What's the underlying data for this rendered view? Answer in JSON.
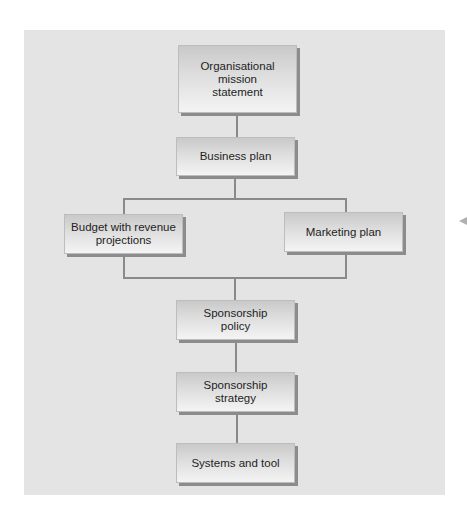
{
  "diagram": {
    "type": "hierarchy-flowchart",
    "nodes": {
      "mission": {
        "label": "Organisational mission statement",
        "lines": [
          "Organisational",
          "mission",
          "statement"
        ]
      },
      "business_plan": {
        "label": "Business plan",
        "lines": [
          "Business plan"
        ]
      },
      "budget": {
        "label": "Budget with revenue projections",
        "lines": [
          "Budget with revenue",
          "projections"
        ]
      },
      "marketing": {
        "label": "Marketing plan",
        "lines": [
          "Marketing plan"
        ]
      },
      "sponsorship_policy": {
        "label": "Sponsorship policy",
        "lines": [
          "Sponsorship",
          "policy"
        ]
      },
      "sponsorship_strategy": {
        "label": "Sponsorship strategy",
        "lines": [
          "Sponsorship",
          "strategy"
        ]
      },
      "systems_tool": {
        "label": "Systems and tool",
        "lines": [
          "Systems and tool"
        ]
      }
    },
    "edges": [
      {
        "from": "Organisational mission statement",
        "to": "Business plan"
      },
      {
        "from": "Business plan",
        "to": "Budget with revenue projections"
      },
      {
        "from": "Business plan",
        "to": "Marketing plan"
      },
      {
        "from": "Budget with revenue projections",
        "to": "Sponsorship policy"
      },
      {
        "from": "Marketing plan",
        "to": "Sponsorship policy"
      },
      {
        "from": "Sponsorship policy",
        "to": "Sponsorship strategy"
      },
      {
        "from": "Sponsorship strategy",
        "to": "Systems and tool"
      }
    ],
    "colors": {
      "panel_background": "#e4e4e4",
      "box_top": "#c9c9c9",
      "box_bottom": "#f4f4f4",
      "box_shadow": "#8c8c8c",
      "connector": "#8a8a8a",
      "text": "#1e1e1e"
    },
    "side_marker": {
      "icon": "left-pointing-triangle",
      "glyph": "◀"
    }
  }
}
